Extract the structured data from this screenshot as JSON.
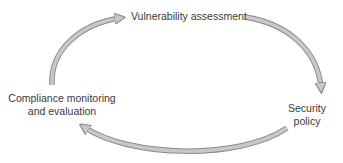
{
  "diagram": {
    "type": "cycle",
    "nodes": [
      {
        "id": "vulnerability",
        "label": "Vulnerability assessment"
      },
      {
        "id": "policy",
        "label_lines": [
          "Security",
          "policy"
        ]
      },
      {
        "id": "compliance",
        "label_lines": [
          "Compliance monitoring",
          "and evaluation"
        ]
      }
    ],
    "edges": [
      {
        "from": "vulnerability",
        "to": "policy"
      },
      {
        "from": "policy",
        "to": "compliance"
      },
      {
        "from": "compliance",
        "to": "vulnerability"
      }
    ],
    "colors": {
      "arrow_fill": "#c8c8c8",
      "arrow_stroke": "#8a8a8a",
      "text": "#3a3a3a"
    }
  }
}
